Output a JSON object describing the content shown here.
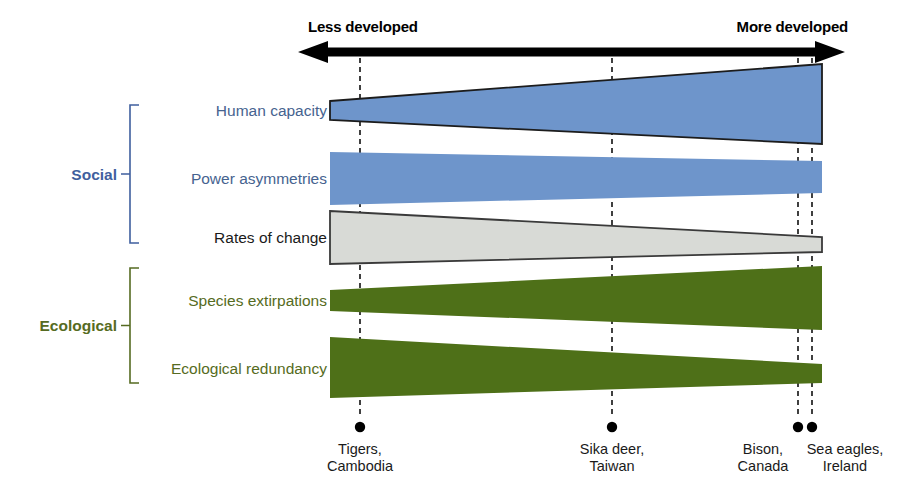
{
  "figure": {
    "axis": {
      "left_caption": "Less developed",
      "right_caption": "More developed",
      "arrow_color": "#000000",
      "arrow_x_start": 298,
      "arrow_x_end": 845,
      "arrow_y": 52
    },
    "groups": [
      {
        "id": "social",
        "label": "Social",
        "color": "#3f5f9e",
        "bracket_top": 105,
        "bracket_bottom": 243
      },
      {
        "id": "ecological",
        "label": "Ecological",
        "color": "#566b22",
        "bracket_top": 268,
        "bracket_bottom": 383
      }
    ],
    "rows": [
      {
        "id": "human-capacity",
        "label": "Human capacity",
        "group": "social",
        "label_color": "#46638f",
        "fill": "#6e95cb",
        "stroke": "#1c1c1c",
        "direction": "widens-right",
        "left_top": 101,
        "left_bottom": 120,
        "right_top": 64,
        "right_bottom": 144
      },
      {
        "id": "power-asymmetries",
        "label": "Power asymmetries",
        "group": "social",
        "label_color": "#46638f",
        "fill": "#6e95cb",
        "stroke": "none",
        "direction": "narrows-right",
        "left_top": 152,
        "left_bottom": 205,
        "right_top": 161,
        "right_bottom": 193
      },
      {
        "id": "rates-of-change",
        "label": "Rates of change",
        "group": "social",
        "label_color": "#1a1a1a",
        "fill": "#d8dad6",
        "stroke": "#3a3a3a",
        "direction": "narrows-right",
        "left_top": 211,
        "left_bottom": 264,
        "right_top": 237,
        "right_bottom": 252
      },
      {
        "id": "species-extirpations",
        "label": "Species extirpations",
        "group": "ecological",
        "label_color": "#566b22",
        "fill": "#4e7018",
        "stroke": "none",
        "direction": "widens-right",
        "left_top": 290,
        "left_bottom": 311,
        "right_top": 266,
        "right_bottom": 330
      },
      {
        "id": "ecological-redundancy",
        "label": "Ecological redundancy",
        "group": "ecological",
        "label_color": "#566b22",
        "fill": "#4e7018",
        "stroke": "none",
        "direction": "narrows-right",
        "left_top": 337,
        "left_bottom": 398,
        "right_top": 364,
        "right_bottom": 383
      }
    ],
    "bars": {
      "x_left": 330,
      "x_right": 822
    },
    "markers": [
      {
        "id": "tigers-cambodia",
        "x": 360,
        "dot_y": 427,
        "line1": "Tigers,",
        "line2": "Cambodia"
      },
      {
        "id": "sika-deer-taiwan",
        "x": 612,
        "dot_y": 427,
        "line1": "Sika deer,",
        "line2": "Taiwan"
      },
      {
        "id": "bison-canada",
        "x": 798,
        "dot_y": 427,
        "line1": "Bison,",
        "line2": "Canada"
      },
      {
        "id": "sea-eagles-ireland",
        "x": 812,
        "dot_y": 427,
        "line1": "Sea eagles,",
        "line2": "Ireland"
      }
    ],
    "guide_line": {
      "color": "#111111",
      "dash": "5,4",
      "top": 58,
      "bottom": 418
    }
  }
}
